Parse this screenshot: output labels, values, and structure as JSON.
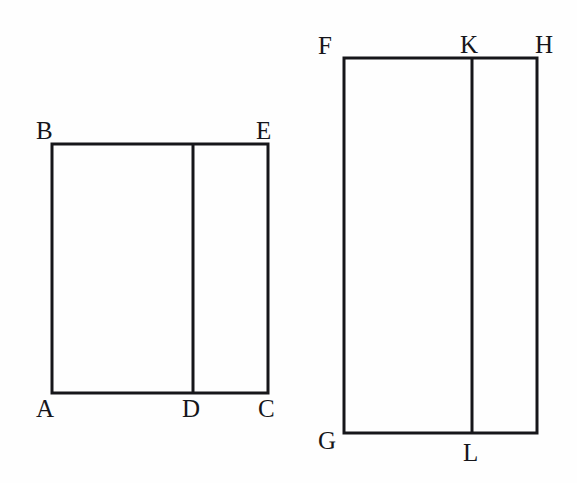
{
  "figure": {
    "background_color": "#fefefe",
    "stroke_color": "#16161a",
    "stroke_width": 3,
    "canvas": {
      "width": 577,
      "height": 483
    },
    "shapes": [
      {
        "name": "left-rectangle",
        "id": "ABCE",
        "x": 52,
        "y": 144,
        "width": 216,
        "height": 249,
        "divider_x": 192,
        "divider_name": "segment-DE",
        "corners": {
          "top_left": "B",
          "top_right": "E",
          "bottom_left": "A",
          "bottom_right": "C"
        },
        "divider_endpoints": {
          "top": "E",
          "bottom": "D"
        }
      },
      {
        "name": "right-rectangle",
        "id": "FGHK",
        "x": 344,
        "y": 58,
        "width": 193,
        "height": 375,
        "divider_x": 472,
        "divider_name": "segment-KL",
        "corners": {
          "top_left": "F",
          "top_right": "H",
          "bottom_left": "G",
          "bottom_right": "L-right"
        },
        "divider_endpoints": {
          "top": "K",
          "bottom": "L"
        }
      }
    ],
    "labels": {
      "left": {
        "B": "B",
        "E": "E",
        "A": "A",
        "D": "D",
        "C": "C"
      },
      "right": {
        "F": "F",
        "K": "K",
        "H": "H",
        "G": "G",
        "L": "L"
      }
    }
  }
}
